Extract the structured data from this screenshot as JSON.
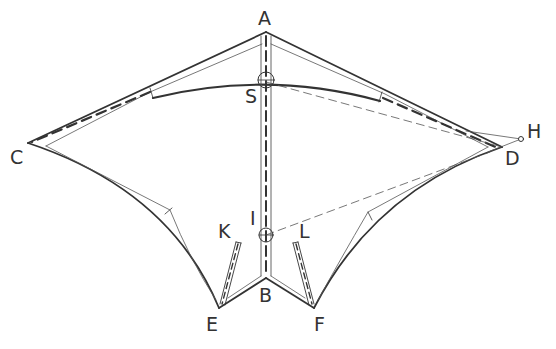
{
  "diagram": {
    "colors": {
      "ink": "#333333",
      "thin": "#555555",
      "background": "#ffffff"
    },
    "labels": {
      "A": "A",
      "S": "S",
      "C": "C",
      "D": "D",
      "H": "H",
      "I": "I",
      "K": "K",
      "L": "L",
      "B": "B",
      "E": "E",
      "F": "F"
    },
    "points": {
      "A": [
        266,
        32
      ],
      "S": [
        266,
        80
      ],
      "C": [
        28,
        143
      ],
      "D": [
        502,
        147
      ],
      "H": [
        521,
        139
      ],
      "I": [
        266,
        235
      ],
      "B": [
        266,
        278
      ],
      "E": [
        219,
        308
      ],
      "F": [
        314,
        308
      ]
    }
  }
}
